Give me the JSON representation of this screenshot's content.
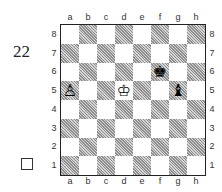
{
  "diagram": {
    "number": "22",
    "to_move": "white",
    "files": [
      "a",
      "b",
      "c",
      "d",
      "e",
      "f",
      "g",
      "h"
    ],
    "ranks": [
      "8",
      "7",
      "6",
      "5",
      "4",
      "3",
      "2",
      "1"
    ],
    "pieces": [
      {
        "square": "a5",
        "color": "white",
        "type": "pawn",
        "glyph": "♙"
      },
      {
        "square": "d5",
        "color": "white",
        "type": "king",
        "glyph": "♔"
      },
      {
        "square": "f6",
        "color": "black",
        "type": "king",
        "glyph": "♚"
      },
      {
        "square": "g5",
        "color": "black",
        "type": "bishop",
        "glyph": "♝"
      }
    ]
  },
  "colors": {
    "light_square": "#ffffff",
    "dark_square": "#b8b8b8",
    "border": "#222222"
  }
}
